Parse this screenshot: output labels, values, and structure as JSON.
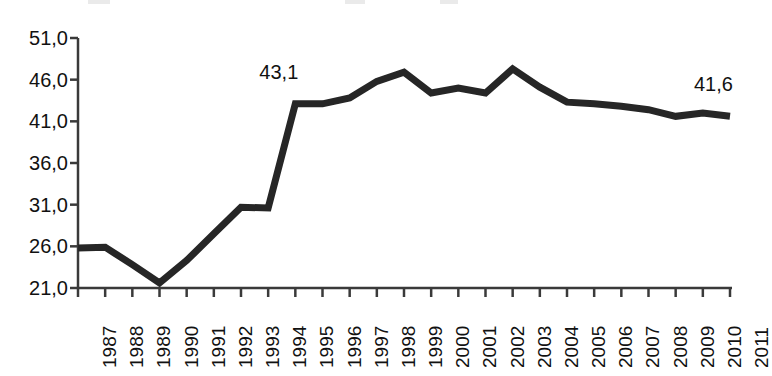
{
  "chart_data": {
    "type": "line",
    "title": "",
    "subtitle": "",
    "xlabel": "",
    "ylabel": "",
    "grid": false,
    "legend": false,
    "legend_position": "none",
    "decimal_separator": ",",
    "line_color": "#262626",
    "line_width_px": 7,
    "xlim": [
      1987,
      2011
    ],
    "ylim": [
      21.0,
      51.0
    ],
    "y_ticks": [
      21.0,
      26.0,
      31.0,
      36.0,
      41.0,
      46.0,
      51.0
    ],
    "y_tick_labels": [
      "21,0",
      "26,0",
      "31,0",
      "36,0",
      "41,0",
      "46,0",
      "51,0"
    ],
    "categories": [
      "1987",
      "1988",
      "1989",
      "1990",
      "1991",
      "1992",
      "1993",
      "1994",
      "1995",
      "1996",
      "1997",
      "1998",
      "1999",
      "2000",
      "2001",
      "2002",
      "2003",
      "2004",
      "2005",
      "2006",
      "2007",
      "2008",
      "2009",
      "2010",
      "2011"
    ],
    "values": [
      25.8,
      25.9,
      23.8,
      21.6,
      24.3,
      27.5,
      30.7,
      30.6,
      43.1,
      43.1,
      43.8,
      45.8,
      46.9,
      44.4,
      45.0,
      44.4,
      47.3,
      45.1,
      43.3,
      43.1,
      42.8,
      42.4,
      41.6,
      42.0,
      41.6
    ],
    "annotations": [
      {
        "label": "43,1",
        "category": "1995",
        "value": 43.1
      },
      {
        "label": "41,6",
        "category": "2011",
        "value": 41.6
      }
    ]
  },
  "axes": {
    "y_axis_name": "y-axis",
    "x_axis_name": "x-axis"
  }
}
